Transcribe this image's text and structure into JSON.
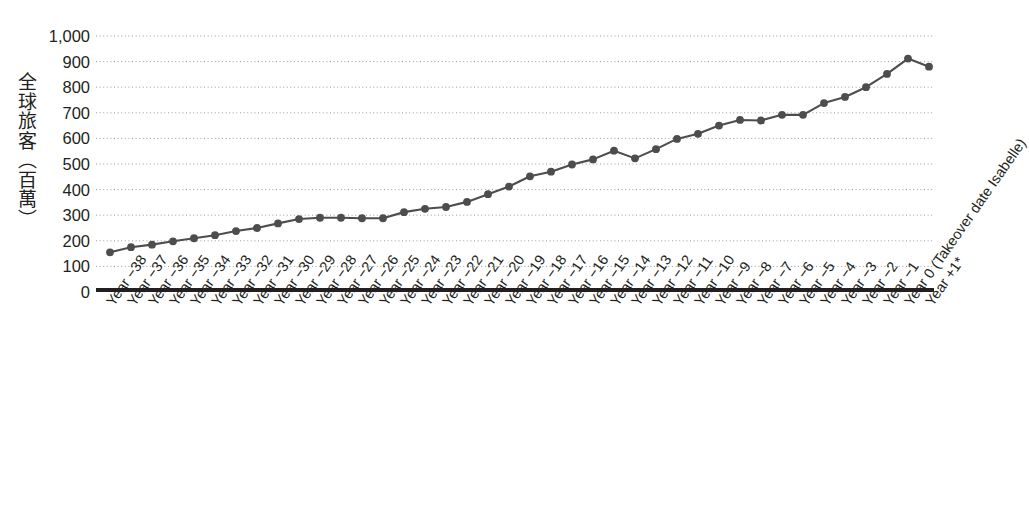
{
  "chart_data": {
    "type": "line",
    "title": "",
    "xlabel": "",
    "ylabel": "全球旅客（百萬）",
    "ylim": [
      0,
      1000
    ],
    "ytick_values": [
      0,
      100,
      200,
      300,
      400,
      500,
      600,
      700,
      800,
      900,
      1000
    ],
    "ytick_labels": [
      "0",
      "100",
      "200",
      "300",
      "400",
      "500",
      "600",
      "700",
      "800",
      "900",
      "1,000"
    ],
    "grid": "horizontal-dotted",
    "legend": "none",
    "marker": "filled-circle",
    "series_color": "#4d4d4d",
    "categories": [
      "Year −38",
      "Year −37",
      "Year −36",
      "Year −35",
      "Year −34",
      "Year −33",
      "Year −32",
      "Year −31",
      "Year −30",
      "Year −29",
      "Year −28",
      "Year −27",
      "Year −26",
      "Year −25",
      "Year −24",
      "Year −23",
      "Year −22",
      "Year −21",
      "Year −20",
      "Year −19",
      "Year −18",
      "Year −17",
      "Year −16",
      "Year −15",
      "Year −14",
      "Year −13",
      "Year −12",
      "Year −11",
      "Year −10",
      "Year −9",
      "Year −8",
      "Year −7",
      "Year −6",
      "Year −5",
      "Year −4",
      "Year −3",
      "Year −2",
      "Year −1",
      "Year 0 (Takeover date Isabelle)",
      "Year +1*"
    ],
    "values": [
      155,
      175,
      185,
      198,
      210,
      222,
      238,
      250,
      268,
      285,
      290,
      290,
      288,
      288,
      312,
      325,
      332,
      352,
      382,
      412,
      452,
      470,
      498,
      518,
      552,
      522,
      558,
      598,
      618,
      650,
      672,
      670,
      692,
      692,
      738,
      762,
      800,
      852,
      912,
      880
    ]
  },
  "axis": {
    "y_title": "全球旅客（百萬）"
  },
  "footnote": {
    "text": ""
  }
}
